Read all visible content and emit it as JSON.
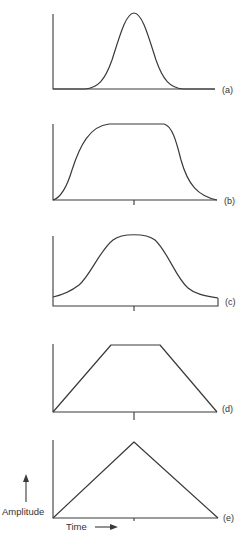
{
  "figure": {
    "type": "pulse-shape-comparison",
    "panels": [
      {
        "id": "a",
        "label": "(a)",
        "shape": "gaussian"
      },
      {
        "id": "b",
        "label": "(b)",
        "shape": "flat-topped smooth pulse"
      },
      {
        "id": "c",
        "label": "(c)",
        "shape": "bell with raised baseline"
      },
      {
        "id": "d",
        "label": "(d)",
        "shape": "trapezoid"
      },
      {
        "id": "e",
        "label": "(e)",
        "shape": "triangle"
      }
    ],
    "y_axis_label": "Amplitude",
    "x_axis_label": "Time",
    "colors": {
      "line": "#3a3a3a",
      "background": "#ffffff"
    }
  }
}
